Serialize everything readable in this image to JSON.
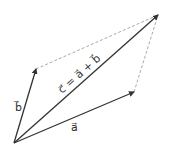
{
  "diagram": {
    "colors": {
      "vector": "#333333",
      "dashed": "#aaaaaa",
      "background": "#ffffff"
    },
    "origin": {
      "x": 14,
      "y": 143
    },
    "vectors": [
      {
        "id": "a",
        "label": "a⃗",
        "tip": {
          "x": 134,
          "y": 92
        }
      },
      {
        "id": "b",
        "label": "b⃗",
        "tip": {
          "x": 36,
          "y": 69
        }
      },
      {
        "id": "c",
        "label": "c⃗ = a⃗ + b⃗",
        "tip": {
          "x": 158,
          "y": 15
        }
      }
    ],
    "labels": {
      "a": "a⃗",
      "b": "b⃗",
      "c": "c⃗ = a⃗ + b⃗"
    }
  }
}
